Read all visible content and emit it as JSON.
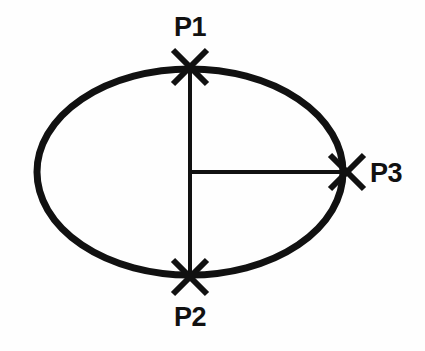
{
  "figure": {
    "background_color": "#fefefe",
    "stroke_color": "#111111",
    "ellipse": {
      "center_x": 190,
      "center_y": 172,
      "radius_x": 153,
      "radius_y": 103,
      "stroke_width": 7
    },
    "axes": {
      "vertical_line": {
        "x": 190,
        "y1": 67,
        "y2": 277,
        "stroke_width": 4
      },
      "horizontal_line": {
        "x1": 190,
        "x2": 347,
        "y": 172,
        "stroke_width": 4
      }
    },
    "markers": {
      "shape": "x-cross",
      "size": 34,
      "stroke_width": 6
    },
    "points": [
      {
        "id": "p1",
        "label": "P1",
        "marker_x": 190,
        "marker_y": 67,
        "label_x": 190,
        "label_y": 36,
        "label_anchor": "middle",
        "position": "top-vertex"
      },
      {
        "id": "p2",
        "label": "P2",
        "marker_x": 190,
        "marker_y": 277,
        "label_x": 190,
        "label_y": 326,
        "label_anchor": "middle",
        "position": "bottom-vertex"
      },
      {
        "id": "p3",
        "label": "P3",
        "marker_x": 347,
        "marker_y": 172,
        "label_x": 370,
        "label_y": 182,
        "label_anchor": "start",
        "position": "right-vertex"
      }
    ]
  }
}
